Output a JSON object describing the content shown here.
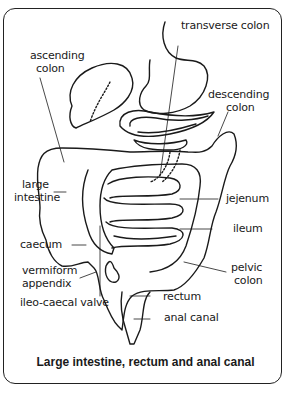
{
  "diagram": {
    "caption": "Large intestine, rectum and anal canal",
    "labels": {
      "transverse_colon": "transverse colon",
      "ascending_colon_1": "ascending",
      "ascending_colon_2": "colon",
      "descending_colon_1": "descending",
      "descending_colon_2": "colon",
      "large_intestine_1": "large",
      "large_intestine_2": "intestine",
      "jejenum": "jejenum",
      "ileum": "ileum",
      "caecum": "caecum",
      "vermiform_appendix_1": "vermiform",
      "vermiform_appendix_2": "appendix",
      "pelvic_colon_1": "pelvic",
      "pelvic_colon_2": "colon",
      "ileo_caecal_valve": "ileo-caecal valve",
      "rectum": "rectum",
      "anal_canal": "anal canal"
    },
    "colors": {
      "line": "#1a1a1a",
      "background": "#ffffff"
    }
  }
}
